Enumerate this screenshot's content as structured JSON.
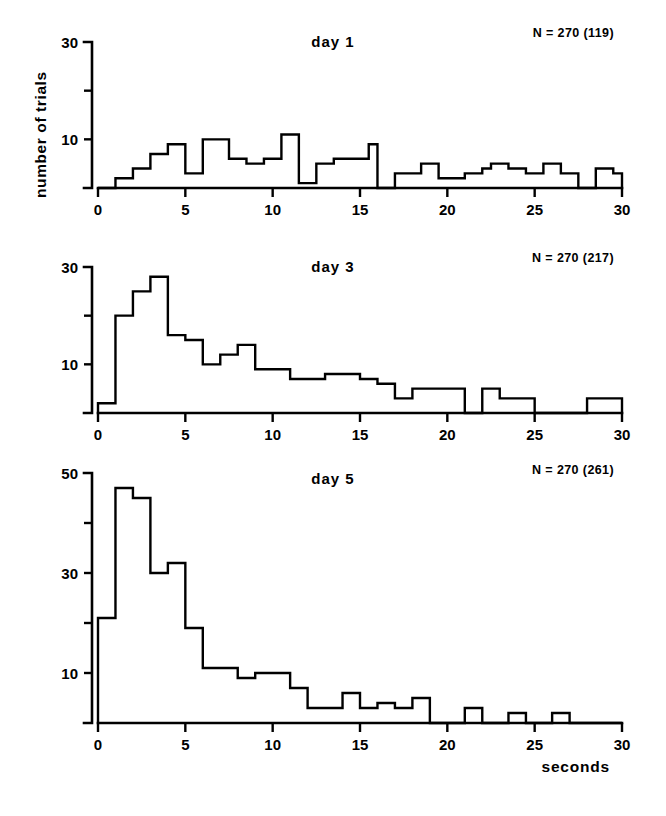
{
  "figure": {
    "ylabel": "number of trials",
    "xlabel": "seconds",
    "background": "#ffffff",
    "ink": "#000000"
  },
  "chart_data": [
    {
      "type": "bar",
      "title": "day 1",
      "annotation": "N = 270 (119)",
      "xlabel": "",
      "ylabel": "number of trials",
      "xlim": [
        0,
        30
      ],
      "ylim": [
        0,
        30
      ],
      "bin_width": 0.5,
      "xticks": [
        0,
        5,
        10,
        15,
        20,
        25,
        30
      ],
      "xtick_labels": [
        "0",
        "5",
        "10",
        "15",
        "20",
        "25",
        "30"
      ],
      "yticks": [
        0,
        10,
        20,
        30
      ],
      "ytick_labels": [
        "",
        "10",
        "",
        "30"
      ],
      "grid": false,
      "legend": "none",
      "bin_starts": [
        0.0,
        0.5,
        1.0,
        1.5,
        2.0,
        2.5,
        3.0,
        3.5,
        4.0,
        4.5,
        5.0,
        5.5,
        6.0,
        6.5,
        7.0,
        7.5,
        8.0,
        8.5,
        9.0,
        9.5,
        10.0,
        10.5,
        11.0,
        11.5,
        12.0,
        12.5,
        13.0,
        13.5,
        14.0,
        14.5,
        15.0,
        15.5,
        16.0,
        16.5,
        17.0,
        17.5,
        18.0,
        18.5,
        19.0,
        19.5,
        20.0,
        20.5,
        21.0,
        21.5,
        22.0,
        22.5,
        23.0,
        23.5,
        24.0,
        24.5,
        25.0,
        25.5,
        26.0,
        26.5,
        27.0,
        27.5,
        28.0,
        28.5,
        29.0,
        29.5
      ],
      "values": [
        0,
        0,
        2,
        2,
        4,
        4,
        7,
        7,
        9,
        9,
        3,
        3,
        10,
        10,
        10,
        6,
        6,
        5,
        5,
        6,
        6,
        11,
        11,
        1,
        1,
        5,
        5,
        6,
        6,
        6,
        6,
        9,
        0,
        0,
        3,
        3,
        3,
        5,
        5,
        2,
        2,
        2,
        3,
        3,
        4,
        5,
        5,
        4,
        4,
        3,
        3,
        5,
        5,
        3,
        3,
        0,
        0,
        4,
        4,
        3
      ]
    },
    {
      "type": "bar",
      "title": "day 3",
      "annotation": "N = 270 (217)",
      "xlabel": "",
      "ylabel": "number of trials",
      "xlim": [
        0,
        30
      ],
      "ylim": [
        0,
        30
      ],
      "bin_width": 0.5,
      "xticks": [
        0,
        5,
        10,
        15,
        20,
        25,
        30
      ],
      "xtick_labels": [
        "0",
        "5",
        "10",
        "15",
        "20",
        "25",
        "30"
      ],
      "yticks": [
        0,
        10,
        20,
        30
      ],
      "ytick_labels": [
        "",
        "10",
        "",
        "30"
      ],
      "grid": false,
      "legend": "none",
      "bin_starts": [
        0.0,
        0.5,
        1.0,
        1.5,
        2.0,
        2.5,
        3.0,
        3.5,
        4.0,
        4.5,
        5.0,
        5.5,
        6.0,
        6.5,
        7.0,
        7.5,
        8.0,
        8.5,
        9.0,
        9.5,
        10.0,
        10.5,
        11.0,
        11.5,
        12.0,
        12.5,
        13.0,
        13.5,
        14.0,
        14.5,
        15.0,
        15.5,
        16.0,
        16.5,
        17.0,
        17.5,
        18.0,
        18.5,
        19.0,
        19.5,
        20.0,
        20.5,
        21.0,
        21.5,
        22.0,
        22.5,
        23.0,
        23.5,
        24.0,
        24.5,
        25.0,
        25.5,
        26.0,
        26.5,
        27.0,
        27.5,
        28.0,
        28.5,
        29.0,
        29.5
      ],
      "values": [
        2,
        2,
        20,
        20,
        25,
        25,
        28,
        28,
        16,
        16,
        15,
        15,
        10,
        10,
        12,
        12,
        14,
        14,
        9,
        9,
        9,
        9,
        7,
        7,
        7,
        7,
        8,
        8,
        8,
        8,
        7,
        7,
        6,
        6,
        3,
        3,
        5,
        5,
        5,
        5,
        5,
        5,
        0,
        0,
        5,
        5,
        3,
        3,
        3,
        3,
        0,
        0,
        0,
        0,
        0,
        0,
        3,
        3,
        3,
        3
      ]
    },
    {
      "type": "bar",
      "title": "day 5",
      "annotation": "N = 270 (261)",
      "xlabel": "seconds",
      "ylabel": "number of trials",
      "xlim": [
        0,
        30
      ],
      "ylim": [
        0,
        50
      ],
      "bin_width": 0.5,
      "xticks": [
        0,
        5,
        10,
        15,
        20,
        25,
        30
      ],
      "xtick_labels": [
        "0",
        "5",
        "10",
        "15",
        "20",
        "25",
        "30"
      ],
      "yticks": [
        0,
        10,
        20,
        30,
        40,
        50
      ],
      "ytick_labels": [
        "",
        "10",
        "",
        "30",
        "",
        "50"
      ],
      "grid": false,
      "legend": "none",
      "bin_starts": [
        0.0,
        0.5,
        1.0,
        1.5,
        2.0,
        2.5,
        3.0,
        3.5,
        4.0,
        4.5,
        5.0,
        5.5,
        6.0,
        6.5,
        7.0,
        7.5,
        8.0,
        8.5,
        9.0,
        9.5,
        10.0,
        10.5,
        11.0,
        11.5,
        12.0,
        12.5,
        13.0,
        13.5,
        14.0,
        14.5,
        15.0,
        15.5,
        16.0,
        16.5,
        17.0,
        17.5,
        18.0,
        18.5,
        19.0,
        19.5,
        20.0,
        20.5,
        21.0,
        21.5,
        22.0,
        22.5,
        23.0,
        23.5,
        24.0,
        24.5,
        25.0,
        25.5,
        26.0,
        26.5,
        27.0,
        27.5,
        28.0,
        28.5,
        29.0,
        29.5
      ],
      "values": [
        21,
        21,
        47,
        47,
        45,
        45,
        30,
        30,
        32,
        32,
        19,
        19,
        11,
        11,
        11,
        11,
        9,
        9,
        10,
        10,
        10,
        10,
        7,
        7,
        3,
        3,
        3,
        3,
        6,
        6,
        3,
        3,
        4,
        4,
        3,
        3,
        5,
        5,
        0,
        0,
        0,
        0,
        3,
        3,
        0,
        0,
        0,
        2,
        2,
        0,
        0,
        0,
        2,
        2,
        0,
        0,
        0,
        0,
        0,
        0
      ]
    }
  ]
}
